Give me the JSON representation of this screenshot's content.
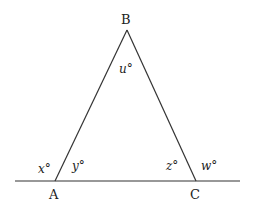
{
  "diagram": {
    "type": "geometry-triangle",
    "vertices": [
      {
        "id": "A",
        "label": "A"
      },
      {
        "id": "B",
        "label": "B"
      },
      {
        "id": "C",
        "label": "C"
      }
    ],
    "angles": {
      "apex_B": "u°",
      "exterior_A": "x°",
      "interior_A": "y°",
      "interior_C": "z°",
      "exterior_C": "w°"
    },
    "colors": {
      "line": "#333333",
      "text": "#222222",
      "background": "#ffffff"
    }
  }
}
